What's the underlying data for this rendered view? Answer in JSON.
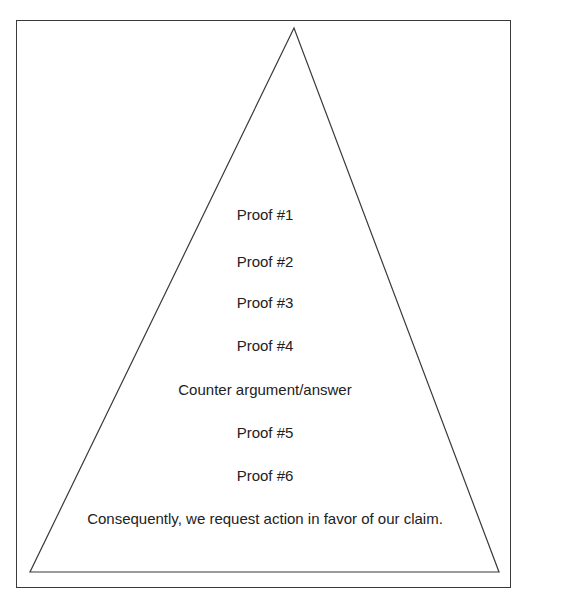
{
  "diagram": {
    "shape": "pyramid",
    "levels": [
      "Proof #1",
      "Proof #2",
      "Proof #3",
      "Proof #4",
      "Counter argument/answer",
      "Proof #5",
      "Proof #6",
      "Consequently, we request action in favor of our claim."
    ],
    "colors": {
      "stroke": "#3a3a3a",
      "text": "#222222",
      "background": "#ffffff"
    }
  }
}
